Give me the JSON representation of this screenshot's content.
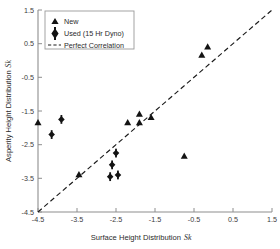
{
  "chart_data": {
    "type": "scatter",
    "title": "",
    "xlabel": "Surface Height Distribution Sk",
    "xlabel_main": "Surface Height Distribution",
    "xlabel_symbol": "Sk",
    "ylabel": "Asperity Height Distribution Sk",
    "ylabel_main": "Asperity Height Distribution",
    "ylabel_symbol": "Sk",
    "xlim": [
      -4.5,
      1.5
    ],
    "ylim": [
      -4.5,
      1.5
    ],
    "xticks": [
      -4.5,
      -3.5,
      -2.5,
      -1.5,
      -0.5,
      0.5,
      1.5
    ],
    "yticks": [
      -4.5,
      -3.5,
      -2.5,
      -1.5,
      -0.5,
      0.5,
      1.5
    ],
    "xtick_labels": [
      "-4.5",
      "-3.5",
      "-2.5",
      "-1.5",
      "-0.5",
      "0.5",
      "1.5"
    ],
    "ytick_labels": [
      "-4.5",
      "-3.5",
      "-2.5",
      "-1.5",
      "-0.5",
      "0.5",
      "1.5"
    ],
    "grid": false,
    "legend_position": "top-left",
    "series": [
      {
        "name": "New",
        "marker": "triangle",
        "color": "#131313",
        "points": [
          [
            -4.5,
            -1.85
          ],
          [
            -3.45,
            -3.4
          ],
          [
            -2.2,
            -1.85
          ],
          [
            -1.9,
            -1.85
          ],
          [
            -1.9,
            -1.6
          ],
          [
            -1.6,
            -1.7
          ],
          [
            -0.75,
            -2.85
          ],
          [
            -0.3,
            0.15
          ],
          [
            -0.15,
            0.4
          ]
        ]
      },
      {
        "name": "Used (15 Hr Dyno)",
        "marker": "diamond",
        "color": "#131313",
        "points": [
          [
            -4.15,
            -2.2
          ],
          [
            -3.9,
            -1.75
          ],
          [
            -2.65,
            -3.45
          ],
          [
            -2.6,
            -3.1
          ],
          [
            -2.45,
            -3.4
          ],
          [
            -2.5,
            -2.75
          ]
        ]
      }
    ],
    "reference_line": {
      "name": "Perfect Correlation",
      "style": "dashed",
      "color": "#1a1a1a",
      "from": [
        -4.5,
        -4.5
      ],
      "to": [
        1.5,
        1.5
      ]
    },
    "legend": [
      {
        "label": "New",
        "marker": "triangle"
      },
      {
        "label": "Used (15 Hr Dyno)",
        "marker": "diamond"
      },
      {
        "label": "Perfect Correlation",
        "marker": "dashed-line"
      }
    ]
  }
}
